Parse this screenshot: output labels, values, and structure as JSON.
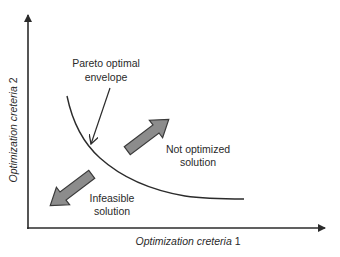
{
  "diagram": {
    "type": "pareto-front-concept",
    "axes": {
      "x": {
        "label_italic": "Optimization creteria",
        "label_suffix": " 1"
      },
      "y": {
        "label_italic": "Optimization creteria",
        "label_suffix": " 2"
      }
    },
    "annotations": {
      "pareto": {
        "line1": "Pareto optimal",
        "line2": "envelope"
      },
      "not_optimized": {
        "line1": "Not optimized",
        "line2": "solution"
      },
      "infeasible": {
        "line1": "Infeasible",
        "line2": "solution"
      }
    },
    "colors": {
      "axis": "#2b2b2b",
      "curve": "#2b2b2b",
      "arrow_fill": "#8c8c8c",
      "arrow_stroke": "#3a3a3a",
      "text": "#2a2a2a"
    }
  }
}
